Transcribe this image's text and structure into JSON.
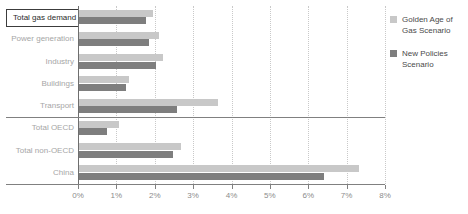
{
  "chart_data": {
    "type": "bar",
    "orientation": "horizontal",
    "title": "",
    "xlabel": "",
    "ylabel": "",
    "xlim": [
      0,
      8
    ],
    "xticks": [
      "0%",
      "1%",
      "2%",
      "3%",
      "4%",
      "5%",
      "6%",
      "7%",
      "8%"
    ],
    "xtick_values": [
      0,
      1,
      2,
      3,
      4,
      5,
      6,
      7,
      8
    ],
    "grid": "vertical-dotted",
    "legend_position": "right",
    "categories": [
      "Total gas demand",
      "Power generation",
      "Industry",
      "Buildings",
      "Transport",
      "Total OECD",
      "Total non-OECD",
      "China"
    ],
    "series": [
      {
        "name": "Golden Age of Gas Scenario",
        "color": "#c8c8c8",
        "values": [
          1.93,
          2.08,
          2.19,
          1.3,
          3.62,
          1.04,
          2.66,
          7.29
        ]
      },
      {
        "name": "New Policies Scenario",
        "color": "#7e7e7e",
        "values": [
          1.75,
          1.82,
          2.0,
          1.22,
          2.55,
          0.73,
          2.45,
          6.38
        ]
      }
    ],
    "highlighted_category": "Total gas demand",
    "group_separators_after": [
      "Transport",
      "China"
    ]
  },
  "legend": {
    "items": [
      {
        "label": "Golden Age of Gas Scenario",
        "color": "#c8c8c8"
      },
      {
        "label": "New Policies Scenario",
        "color": "#7e7e7e"
      }
    ]
  },
  "axis": {
    "ticks": [
      {
        "label": "0%",
        "value": 0
      },
      {
        "label": "1%",
        "value": 1
      },
      {
        "label": "2%",
        "value": 2
      },
      {
        "label": "3%",
        "value": 3
      },
      {
        "label": "4%",
        "value": 4
      },
      {
        "label": "5%",
        "value": 5
      },
      {
        "label": "6%",
        "value": 6
      },
      {
        "label": "7%",
        "value": 7
      },
      {
        "label": "8%",
        "value": 8
      }
    ]
  }
}
